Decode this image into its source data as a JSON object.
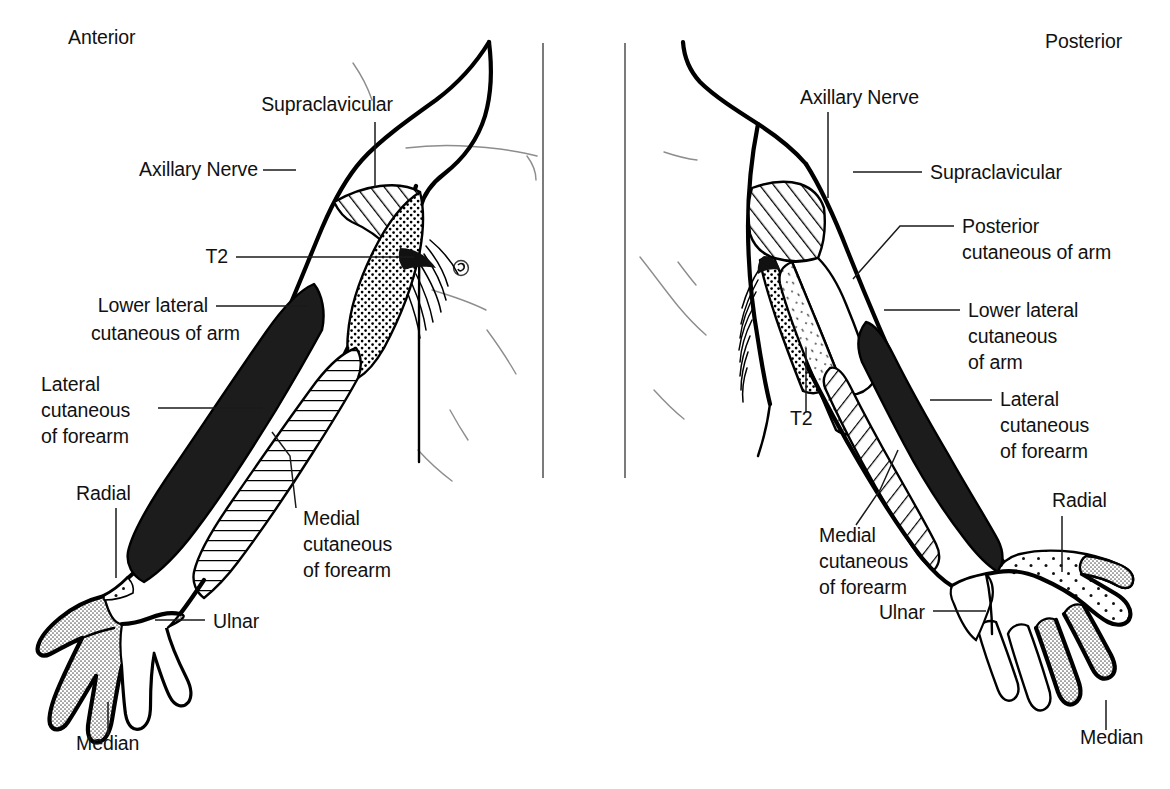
{
  "figure": {
    "type": "anatomical-dermatome-diagram",
    "background_color": "#ffffff",
    "ink_color": "#000000"
  },
  "panels": [
    {
      "id": "anterior",
      "heading": "Anterior",
      "heading_pos": {
        "x": 68,
        "y": 44
      },
      "labels": [
        {
          "key": "supraclavicular",
          "text": "Supraclavicular",
          "x": 393,
          "y": 111,
          "anchor": "end",
          "lines": [
            "Supraclavicular"
          ]
        },
        {
          "key": "axillary_nerve",
          "text": "Axillary Nerve",
          "x": 258,
          "y": 176,
          "anchor": "end",
          "lines": [
            "Axillary Nerve"
          ]
        },
        {
          "key": "t2",
          "text": "T2",
          "x": 228,
          "y": 262,
          "anchor": "end",
          "lines": [
            "T2"
          ]
        },
        {
          "key": "lower_lateral_cutaneous_of_arm",
          "text": "Lower lateral cutaneous of arm",
          "x": 208,
          "y": 311,
          "anchor": "end",
          "lines": [
            "Lower lateral",
            "cutaneous of arm"
          ]
        },
        {
          "key": "lateral_cutaneous_of_forearm",
          "text": "Lateral cutaneous of forearm",
          "x": 150,
          "y": 387,
          "anchor": "end",
          "lines": [
            "Lateral",
            "cutaneous",
            "of forearm"
          ]
        },
        {
          "key": "radial",
          "text": "Radial",
          "x": 76,
          "y": 498,
          "anchor": "start",
          "lines": [
            "Radial"
          ]
        },
        {
          "key": "medial_cutaneous_of_forearm",
          "text": "Medial cutaneous of forearm",
          "x": 303,
          "y": 523,
          "anchor": "start",
          "lines": [
            "Medial",
            "cutaneous",
            "of forearm"
          ]
        },
        {
          "key": "ulnar",
          "text": "Ulnar",
          "x": 213,
          "y": 627,
          "anchor": "start",
          "lines": [
            "Ulnar"
          ]
        },
        {
          "key": "median",
          "text": "Median",
          "x": 76,
          "y": 748,
          "anchor": "start",
          "lines": [
            "Median"
          ]
        }
      ]
    },
    {
      "id": "posterior",
      "heading": "Posterior",
      "heading_pos": {
        "x": 1045,
        "y": 48
      },
      "labels": [
        {
          "key": "axillary_nerve",
          "text": "Axillary Nerve",
          "x": 800,
          "y": 103,
          "anchor": "start",
          "lines": [
            "Axillary Nerve"
          ]
        },
        {
          "key": "supraclavicular",
          "text": "Supraclavicular",
          "x": 930,
          "y": 177,
          "anchor": "start",
          "lines": [
            "Supraclavicular"
          ]
        },
        {
          "key": "posterior_cutaneous_of_arm",
          "text": "Posterior cutaneous of arm",
          "x": 962,
          "y": 231,
          "anchor": "start",
          "lines": [
            "Posterior",
            "cutaneous of arm"
          ]
        },
        {
          "key": "lower_lateral_cutaneous_of_arm",
          "text": "Lower lateral cutaneous of arm",
          "x": 968,
          "y": 315,
          "anchor": "start",
          "lines": [
            "Lower lateral",
            "cutaneous",
            "of arm"
          ]
        },
        {
          "key": "lateral_cutaneous_of_forearm",
          "text": "Lateral cutaneous of forearm",
          "x": 1000,
          "y": 404,
          "anchor": "start",
          "lines": [
            "Lateral",
            "cutaneous",
            "of forearm"
          ]
        },
        {
          "key": "t2",
          "text": "T2",
          "x": 790,
          "y": 423,
          "anchor": "start",
          "lines": [
            "T2"
          ]
        },
        {
          "key": "radial",
          "text": "Radial",
          "x": 1052,
          "y": 505,
          "anchor": "start",
          "lines": [
            "Radial"
          ]
        },
        {
          "key": "medial_cutaneous_of_forearm",
          "text": "Medial cutaneous of forearm",
          "x": 819,
          "y": 540,
          "anchor": "start",
          "lines": [
            "Medial",
            "cutaneous",
            "of forearm"
          ]
        },
        {
          "key": "ulnar",
          "text": "Ulnar",
          "x": 925,
          "y": 617,
          "anchor": "end",
          "lines": [
            "Ulnar"
          ]
        },
        {
          "key": "median",
          "text": "Median",
          "x": 1080,
          "y": 742,
          "anchor": "start",
          "lines": [
            "Median"
          ]
        }
      ]
    }
  ],
  "legend_patterns": [
    {
      "key": "diagonal-hatch",
      "meaning": "Supraclavicular / Axillary nerve area",
      "description": "diagonal line hatching"
    },
    {
      "key": "coarse-dots",
      "meaning": "T2 intercostobrachial area",
      "description": "coarse dot stipple"
    },
    {
      "key": "horizontal-hatch",
      "meaning": "Medial cutaneous of forearm (anterior)",
      "description": "horizontal line hatching"
    },
    {
      "key": "solid-black",
      "meaning": "Lateral cutaneous of forearm",
      "description": "solid black fill"
    },
    {
      "key": "fine-stipple",
      "meaning": "Median nerve area of hand",
      "description": "fine grey stipple"
    },
    {
      "key": "sparse-dots",
      "meaning": "Radial nerve area of hand dorsum",
      "description": "sparse dot stipple"
    },
    {
      "key": "white",
      "meaning": "Lower lateral cutaneous of arm / Ulnar / Posterior cutaneous of arm",
      "description": "unfilled white"
    }
  ],
  "dividers": [
    {
      "key": "left-divider",
      "x": 543
    },
    {
      "key": "right-divider",
      "x": 625
    }
  ]
}
